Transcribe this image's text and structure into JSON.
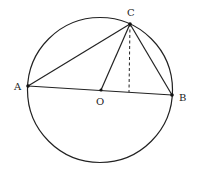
{
  "diagram": {
    "type": "geometry",
    "circle": {
      "center": "O",
      "cx": 100,
      "cy": 90,
      "r": 72
    },
    "points": [
      {
        "name": "A",
        "label": "A",
        "x": 28,
        "y": 86,
        "lx": 14,
        "ly": 90
      },
      {
        "name": "B",
        "label": "B",
        "x": 172,
        "y": 95,
        "lx": 179,
        "ly": 101
      },
      {
        "name": "C",
        "label": "C",
        "x": 130,
        "y": 24,
        "lx": 127,
        "ly": 16
      },
      {
        "name": "O",
        "label": "O",
        "x": 101,
        "y": 90,
        "lx": 96,
        "ly": 105
      }
    ],
    "segments": [
      {
        "name": "AB",
        "from": "A",
        "to": "B",
        "style": "solid"
      },
      {
        "name": "AC",
        "from": "A",
        "to": "C",
        "style": "solid"
      },
      {
        "name": "BC",
        "from": "B",
        "to": "C",
        "style": "solid"
      },
      {
        "name": "OC",
        "from": "O",
        "to": "C",
        "style": "solid"
      },
      {
        "name": "CD",
        "from": "C",
        "to": "foot",
        "style": "dashed"
      }
    ],
    "foot": {
      "x": 129,
      "y": 92
    },
    "colors": {
      "stroke": "#222222",
      "background": "#ffffff"
    }
  }
}
